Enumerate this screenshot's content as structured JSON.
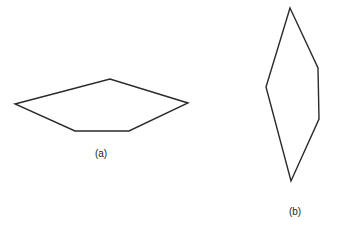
{
  "figure": {
    "polygons": [
      {
        "id": "a",
        "label": "(a)",
        "points": [
          [
            15,
            104
          ],
          [
            110,
            79
          ],
          [
            188,
            103
          ],
          [
            129,
            131
          ],
          [
            75,
            131
          ]
        ],
        "label_pos": [
          101,
          148
        ]
      },
      {
        "id": "b",
        "label": "(b)",
        "points": [
          [
            290,
            8
          ],
          [
            318,
            68
          ],
          [
            319,
            119
          ],
          [
            291,
            181
          ],
          [
            266,
            87
          ]
        ],
        "label_pos": [
          295,
          206
        ]
      }
    ],
    "stroke_color": "#2a2a2a"
  }
}
